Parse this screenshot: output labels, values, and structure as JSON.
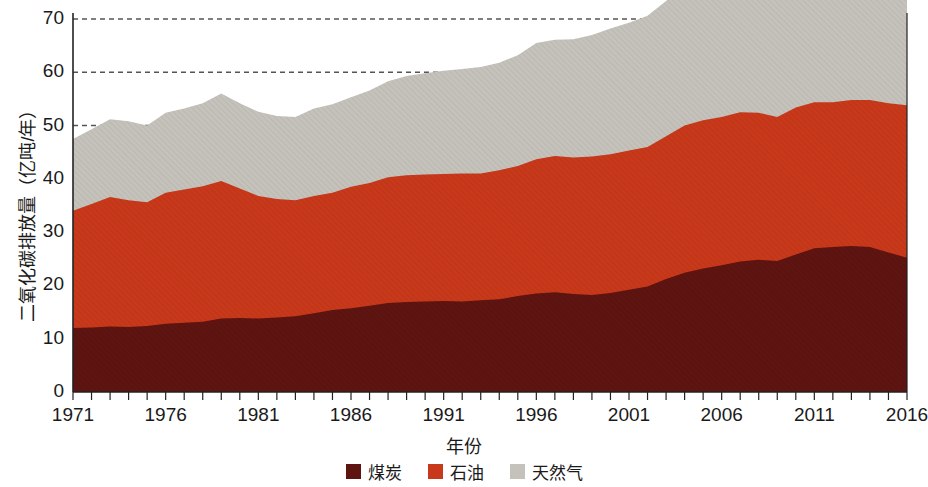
{
  "chart_data": {
    "type": "area",
    "stacked": true,
    "title": "",
    "xlabel": "年份",
    "ylabel": "二氧化碳排放量（亿吨/年）",
    "xlim": [
      1971,
      2016
    ],
    "ylim": [
      0,
      70
    ],
    "grid": true,
    "gridlines_y": [
      40,
      50,
      60,
      70
    ],
    "legend_position": "bottom",
    "x_tick_labels": [
      "1971",
      "1976",
      "1981",
      "1986",
      "1991",
      "1996",
      "2001",
      "2006",
      "2011",
      "2016"
    ],
    "x_tick_values": [
      1971,
      1976,
      1981,
      1986,
      1991,
      1996,
      2001,
      2006,
      2011,
      2016
    ],
    "y_tick_labels": [
      "0",
      "10",
      "20",
      "30",
      "40",
      "50",
      "60",
      "70"
    ],
    "y_tick_values": [
      0,
      10,
      20,
      30,
      40,
      50,
      60,
      70
    ],
    "x": [
      1971,
      1972,
      1973,
      1974,
      1975,
      1976,
      1977,
      1978,
      1979,
      1980,
      1981,
      1982,
      1983,
      1984,
      1985,
      1986,
      1987,
      1988,
      1989,
      1990,
      1991,
      1992,
      1993,
      1994,
      1995,
      1996,
      1997,
      1998,
      1999,
      2000,
      2001,
      2002,
      2003,
      2004,
      2005,
      2006,
      2007,
      2008,
      2009,
      2010,
      2011,
      2012,
      2013,
      2014,
      2015,
      2016
    ],
    "series": [
      {
        "name": "煤炭",
        "color": "#5E1410",
        "values": [
          12.0,
          12.1,
          12.3,
          12.2,
          12.4,
          12.8,
          13.0,
          13.2,
          13.8,
          13.9,
          13.8,
          14.0,
          14.2,
          14.8,
          15.4,
          15.7,
          16.2,
          16.7,
          16.9,
          17.0,
          17.1,
          17.0,
          17.2,
          17.4,
          18.0,
          18.5,
          18.7,
          18.4,
          18.2,
          18.6,
          19.2,
          19.8,
          21.2,
          22.4,
          23.2,
          23.8,
          24.5,
          24.8,
          24.6,
          25.8,
          27.0,
          27.2,
          27.4,
          27.2,
          26.2,
          25.2
        ]
      },
      {
        "name": "石油",
        "color": "#C8381A",
        "values": [
          22.0,
          23.2,
          24.3,
          23.8,
          23.2,
          24.6,
          25.0,
          25.4,
          25.8,
          24.3,
          23.0,
          22.2,
          21.8,
          22.0,
          22.0,
          22.8,
          23.0,
          23.6,
          23.8,
          23.8,
          23.8,
          24.0,
          23.8,
          24.2,
          24.4,
          25.2,
          25.6,
          25.6,
          26.0,
          26.0,
          26.1,
          26.2,
          26.8,
          27.6,
          27.8,
          27.8,
          28.0,
          27.6,
          27.0,
          27.6,
          27.4,
          27.2,
          27.4,
          27.6,
          28.0,
          28.6
        ]
      },
      {
        "name": "天然气",
        "color": "#C5C2BB",
        "values": [
          13.5,
          14.0,
          14.6,
          14.8,
          14.4,
          15.0,
          15.2,
          15.6,
          16.4,
          16.0,
          15.8,
          15.6,
          15.6,
          16.4,
          16.6,
          16.8,
          17.4,
          18.0,
          18.6,
          19.0,
          19.4,
          19.6,
          20.0,
          20.2,
          20.8,
          21.8,
          21.8,
          22.2,
          22.8,
          23.6,
          24.0,
          24.6,
          25.4,
          26.0,
          26.8,
          27.2,
          28.0,
          28.2,
          27.6,
          29.0,
          29.4,
          29.8,
          30.0,
          30.2,
          30.4,
          30.6
        ]
      }
    ]
  },
  "legend": {
    "items": [
      {
        "label": "煤炭",
        "color": "#5E1410"
      },
      {
        "label": "石油",
        "color": "#C8381A"
      },
      {
        "label": "天然气",
        "color": "#C5C2BB"
      }
    ]
  }
}
